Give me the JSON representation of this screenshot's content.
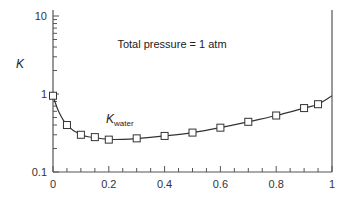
{
  "chart_data": {
    "type": "line",
    "title": "",
    "annotation": "Total pressure = 1 atm",
    "series": [
      {
        "name": "K_water",
        "label_main": "K",
        "label_sub": "water",
        "marker": "open-square",
        "x": [
          0,
          0.05,
          0.1,
          0.15,
          0.2,
          0.3,
          0.4,
          0.5,
          0.6,
          0.7,
          0.8,
          0.9,
          0.95
        ],
        "values": [
          0.95,
          0.4,
          0.3,
          0.28,
          0.26,
          0.27,
          0.29,
          0.32,
          0.37,
          0.44,
          0.53,
          0.66,
          0.74
        ],
        "curve_x": [
          0,
          0.02,
          0.05,
          0.1,
          0.15,
          0.2,
          0.25,
          0.3,
          0.4,
          0.5,
          0.6,
          0.7,
          0.8,
          0.9,
          0.95,
          1.0
        ],
        "curve_y": [
          0.95,
          0.6,
          0.4,
          0.3,
          0.275,
          0.262,
          0.262,
          0.268,
          0.29,
          0.32,
          0.37,
          0.44,
          0.53,
          0.66,
          0.74,
          0.95
        ]
      }
    ],
    "xlabel": "",
    "ylabel": "K",
    "xlim": [
      0,
      1
    ],
    "ylim": [
      0.1,
      10
    ],
    "yscale": "log",
    "x_ticks": [
      "0",
      "0.2",
      "0.4",
      "0.6",
      "0.8",
      "1"
    ],
    "x_tick_values": [
      0,
      0.2,
      0.4,
      0.6,
      0.8,
      1
    ],
    "y_ticks": [
      "0.1",
      "1",
      "10"
    ],
    "y_tick_values": [
      0.1,
      1,
      10
    ],
    "grid": false,
    "legend": "none",
    "colors": {
      "line": "#333333",
      "axis": "#555555",
      "text": "#333333"
    }
  }
}
